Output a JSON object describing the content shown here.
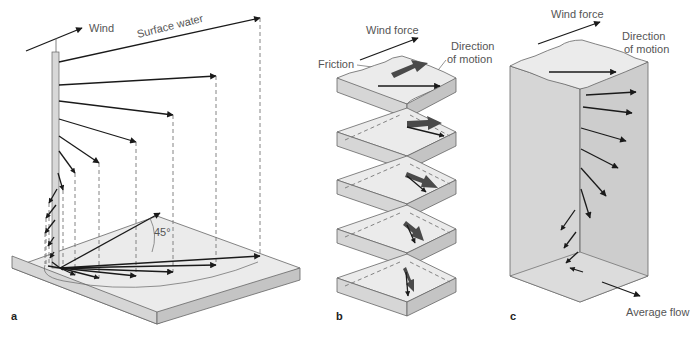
{
  "figure": {
    "panels": [
      {
        "id": "a",
        "letter": "a",
        "labels": {
          "wind": "Wind",
          "surface_water": "Surface water",
          "angle": "45°"
        }
      },
      {
        "id": "b",
        "letter": "b",
        "labels": {
          "wind_force": "Wind force",
          "friction": "Friction",
          "direction_of_motion_line1": "Direction",
          "direction_of_motion_line2": "of motion"
        },
        "layer_count": 5
      },
      {
        "id": "c",
        "letter": "c",
        "labels": {
          "wind_force": "Wind force",
          "direction_of_motion_line1": "Direction",
          "direction_of_motion_line2": "of motion",
          "average_flow": "Average flow"
        }
      }
    ],
    "colors": {
      "slab_top": "#ebebeb",
      "slab_side_light": "#d6d6d6",
      "slab_side_dark": "#c4c4c4",
      "arrow": "#1a1a1a",
      "friction_arrow": "#4a4a4a",
      "label_text": "#555555"
    }
  }
}
